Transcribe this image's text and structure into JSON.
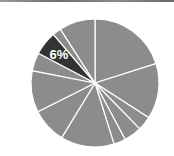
{
  "chart_data": {
    "type": "pie",
    "title": "",
    "start_angle_deg": 0,
    "direction": "clockwise",
    "categories": [
      "s1",
      "s2",
      "s3",
      "s4",
      "s5",
      "s6",
      "s7",
      "s8",
      "s9",
      "s10",
      "s11",
      "s12"
    ],
    "values": [
      20.1,
      14.0,
      3.6,
      4.5,
      3.0,
      13.5,
      8.9,
      10.5,
      4.6,
      6.0,
      2.2,
      9.1
    ],
    "highlighted_index": 9,
    "labels": [
      {
        "index": 9,
        "text": "6%"
      }
    ],
    "legend": "none",
    "colors": {
      "default_slice": "#8c8c8c",
      "highlighted_slice": "#333333",
      "separator": "#ffffff",
      "label_text": "#ffffff"
    }
  },
  "pie": {
    "center": [
      95,
      83
    ],
    "radius": 64
  },
  "highlight_label": "6%"
}
